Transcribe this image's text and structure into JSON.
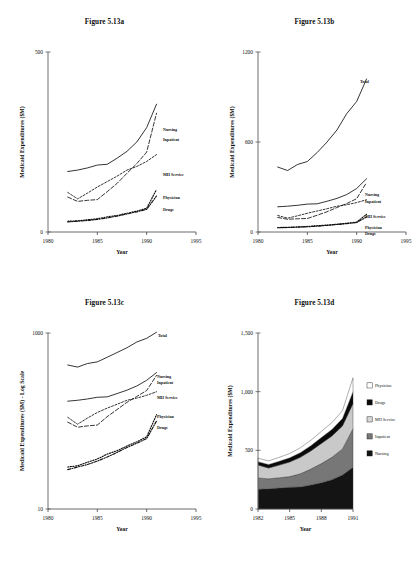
{
  "page": {
    "background": "#ffffff",
    "ink": "#111111"
  },
  "panels": {
    "a": {
      "title": "Figure 5.13a",
      "ylabel": "Medicaid Expenditures ($M)",
      "xlabel": "Year"
    },
    "b": {
      "title": "Figure 5.13b",
      "ylabel": "Medicaid Expenditures ($M)",
      "xlabel": "Year"
    },
    "c": {
      "title": "Figure 5.13c",
      "ylabel": "Medicaid Expenditures ($M) - Log Scale",
      "xlabel": "Year"
    },
    "d": {
      "title": "Figure 5.13d",
      "ylabel": "Medicaid Expenditures ($M)",
      "xlabel": "Year"
    }
  },
  "chart_data": [
    {
      "id": "a",
      "type": "line",
      "title": "Figure 5.13a",
      "xlabel": "Year",
      "ylabel": "Medicaid Expenditures ($M)",
      "xlim": [
        1980,
        1995
      ],
      "ylim": [
        0,
        500
      ],
      "xticks": [
        1980,
        1985,
        1990,
        1995
      ],
      "yticks": [
        0,
        500
      ],
      "ytick_labels": [
        "0",
        "500"
      ],
      "grid": false,
      "legend": "inline-right-end-labels",
      "x": [
        1982,
        1983,
        1984,
        1985,
        1986,
        1987,
        1988,
        1989,
        1990,
        1991
      ],
      "series": [
        {
          "name": "Nursing",
          "style": "solid",
          "values": [
            168,
            172,
            178,
            186,
            188,
            205,
            224,
            250,
            290,
            355
          ]
        },
        {
          "name": "Inpatient",
          "style": "dashed",
          "values": [
            97,
            85,
            88,
            90,
            112,
            135,
            163,
            190,
            222,
            330
          ]
        },
        {
          "name": "MH Service",
          "style": "fine-dashed",
          "values": [
            110,
            92,
            108,
            125,
            140,
            155,
            172,
            182,
            196,
            215
          ]
        },
        {
          "name": "Physician",
          "style": "dotted",
          "values": [
            30,
            31,
            34,
            37,
            42,
            46,
            52,
            58,
            66,
            118
          ]
        },
        {
          "name": "Drugs",
          "style": "dash-dot",
          "values": [
            28,
            30,
            32,
            35,
            39,
            44,
            50,
            56,
            63,
            100
          ]
        }
      ]
    },
    {
      "id": "b",
      "type": "line",
      "title": "Figure 5.13b",
      "xlabel": "Year",
      "ylabel": "Medicaid Expenditures ($M)",
      "xlim": [
        1980,
        1995
      ],
      "ylim": [
        0,
        1200
      ],
      "xticks": [
        1980,
        1985,
        1990,
        1995
      ],
      "yticks": [
        0,
        600,
        1200
      ],
      "ytick_labels": [
        "0",
        "600",
        "1200"
      ],
      "grid": false,
      "legend": "inline-right-end-labels",
      "x": [
        1982,
        1983,
        1984,
        1985,
        1986,
        1987,
        1988,
        1989,
        1990,
        1991
      ],
      "series": [
        {
          "name": "Total",
          "style": "solid",
          "values": [
            433,
            410,
            450,
            470,
            530,
            600,
            680,
            790,
            870,
            1020
          ]
        },
        {
          "name": "Nursing",
          "style": "solid",
          "values": [
            168,
            172,
            178,
            186,
            188,
            205,
            224,
            250,
            290,
            355
          ]
        },
        {
          "name": "Inpatient",
          "style": "dashed",
          "values": [
            97,
            85,
            88,
            90,
            112,
            135,
            163,
            190,
            222,
            330
          ]
        },
        {
          "name": "MH Service",
          "style": "fine-dashed",
          "values": [
            110,
            92,
            108,
            125,
            140,
            155,
            172,
            182,
            196,
            215
          ]
        },
        {
          "name": "Physician",
          "style": "dotted",
          "values": [
            30,
            31,
            34,
            37,
            42,
            46,
            52,
            58,
            66,
            118
          ]
        },
        {
          "name": "Drugs",
          "style": "dash-dot",
          "values": [
            28,
            30,
            32,
            35,
            39,
            44,
            50,
            56,
            63,
            100
          ]
        }
      ]
    },
    {
      "id": "c",
      "type": "line",
      "scale": "log",
      "title": "Figure 5.13c",
      "xlabel": "Year",
      "ylabel": "Medicaid Expenditures ($M) - Log Scale",
      "xlim": [
        1980,
        1995
      ],
      "ylim": [
        10,
        1000
      ],
      "xticks": [
        1980,
        1985,
        1990,
        1995
      ],
      "yticks": [
        10,
        1000
      ],
      "ytick_labels": [
        "10",
        "1000"
      ],
      "grid": false,
      "legend": "inline-right-end-labels",
      "x": [
        1982,
        1983,
        1984,
        1985,
        1986,
        1987,
        1988,
        1989,
        1990,
        1991
      ],
      "series": [
        {
          "name": "Total",
          "style": "solid",
          "values": [
            433,
            410,
            450,
            470,
            530,
            600,
            680,
            790,
            870,
            1020
          ]
        },
        {
          "name": "Nursing",
          "style": "solid",
          "values": [
            168,
            172,
            178,
            186,
            188,
            205,
            224,
            250,
            290,
            355
          ]
        },
        {
          "name": "Inpatient",
          "style": "dashed",
          "values": [
            97,
            85,
            88,
            90,
            112,
            135,
            163,
            190,
            222,
            330
          ]
        },
        {
          "name": "MH Service",
          "style": "fine-dashed",
          "values": [
            110,
            92,
            108,
            125,
            140,
            155,
            172,
            182,
            196,
            215
          ]
        },
        {
          "name": "Physician",
          "style": "dotted",
          "values": [
            30,
            31,
            34,
            37,
            42,
            46,
            52,
            58,
            66,
            118
          ]
        },
        {
          "name": "Drugs",
          "style": "dash-dot",
          "values": [
            28,
            30,
            32,
            35,
            39,
            44,
            50,
            56,
            63,
            100
          ]
        }
      ]
    },
    {
      "id": "d",
      "type": "area",
      "stacked": true,
      "title": "Figure 5.13d",
      "xlabel": "Year",
      "ylabel": "Medicaid Expenditures ($M)",
      "xlim": [
        1982,
        1991
      ],
      "ylim": [
        0,
        1500
      ],
      "xticks": [
        1982,
        1985,
        1988,
        1991
      ],
      "yticks": [
        0,
        500,
        1000,
        1500
      ],
      "ytick_labels": [
        "0",
        "500",
        "1,000",
        "1,500"
      ],
      "grid": false,
      "legend_position": "right",
      "legend_order": [
        "Physician",
        "Drugs",
        "MH Service",
        "Inpatient",
        "Nursing"
      ],
      "x": [
        1982,
        1983,
        1984,
        1985,
        1986,
        1987,
        1988,
        1989,
        1990,
        1991
      ],
      "series": [
        {
          "name": "Nursing",
          "fill": "#141414",
          "swatch": "#141414",
          "values": [
            168,
            172,
            178,
            186,
            188,
            205,
            224,
            250,
            290,
            355
          ]
        },
        {
          "name": "Inpatient",
          "fill": "#777777",
          "swatch": "#777777",
          "values": [
            97,
            85,
            88,
            90,
            112,
            135,
            163,
            190,
            222,
            330
          ]
        },
        {
          "name": "MH Service",
          "fill": "#c9c9c9",
          "swatch": "#d8d8d8",
          "values": [
            110,
            92,
            108,
            125,
            140,
            155,
            172,
            182,
            196,
            215
          ]
        },
        {
          "name": "Drugs",
          "fill": "#0a0a0a",
          "swatch": "#0a0a0a",
          "values": [
            28,
            30,
            32,
            35,
            39,
            44,
            50,
            56,
            63,
            100
          ]
        },
        {
          "name": "Physician",
          "fill": "#ffffff",
          "swatch": "#ffffff",
          "values": [
            30,
            31,
            34,
            37,
            42,
            46,
            52,
            58,
            66,
            118
          ]
        }
      ]
    }
  ]
}
